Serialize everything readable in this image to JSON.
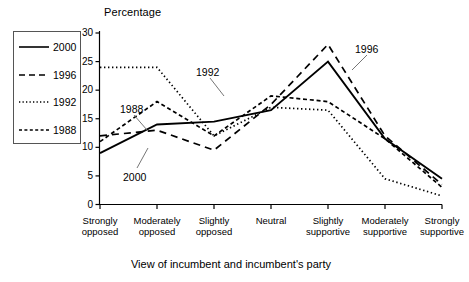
{
  "chart_data": {
    "type": "line",
    "title": "",
    "ylabel": "Percentage",
    "xlabel": "View of incumbent and incumbent's party",
    "ylim": [
      0,
      30
    ],
    "yticks": [
      0,
      5,
      10,
      15,
      20,
      25,
      30
    ],
    "grid": false,
    "legend_position": "left-outside",
    "categories": [
      "Strongly opposed",
      "Moderately opposed",
      "Slightly opposed",
      "Neutral",
      "Slightly supportive",
      "Moderately supportive",
      "Strongly supportive"
    ],
    "category_lines": [
      [
        "Strongly",
        "opposed"
      ],
      [
        "Moderately",
        "opposed"
      ],
      [
        "Slightly",
        "opposed"
      ],
      [
        "Neutral",
        ""
      ],
      [
        "Slightly",
        "supportive"
      ],
      [
        "Moderately",
        "supportive"
      ],
      [
        "Strongly",
        "supportive"
      ]
    ],
    "series": [
      {
        "name": "2000",
        "style": "solid",
        "values": [
          9.0,
          14.0,
          14.5,
          16.5,
          25.0,
          11.5,
          4.5
        ]
      },
      {
        "name": "1996",
        "style": "dashed",
        "values": [
          12.0,
          13.0,
          9.5,
          17.5,
          28.0,
          12.0,
          3.5
        ]
      },
      {
        "name": "1992",
        "style": "dotted",
        "values": [
          24.0,
          24.0,
          12.0,
          17.0,
          16.5,
          4.5,
          1.5
        ]
      },
      {
        "name": "1988",
        "style": "fine-dashed",
        "values": [
          11.0,
          18.0,
          12.0,
          19.0,
          18.0,
          11.5,
          3.0
        ]
      }
    ],
    "annotations": [
      {
        "text": "1992",
        "x": 196,
        "y": 66
      },
      {
        "text": "1988",
        "x": 120,
        "y": 103
      },
      {
        "text": "2000",
        "x": 123,
        "y": 171
      },
      {
        "text": "1996",
        "x": 355,
        "y": 43
      }
    ]
  },
  "legend": {
    "items": [
      {
        "label": "2000",
        "style": "solid"
      },
      {
        "label": "1996",
        "style": "dashed"
      },
      {
        "label": "1992",
        "style": "dotted"
      },
      {
        "label": "1988",
        "style": "fine-dashed"
      }
    ]
  },
  "axis": {
    "y_tick_labels": [
      "30",
      "25",
      "20",
      "15",
      "10",
      "5",
      "0"
    ]
  },
  "colors": {
    "line": "#000000",
    "axis": "#000000",
    "background": "#ffffff",
    "legend_border": "#555555"
  }
}
